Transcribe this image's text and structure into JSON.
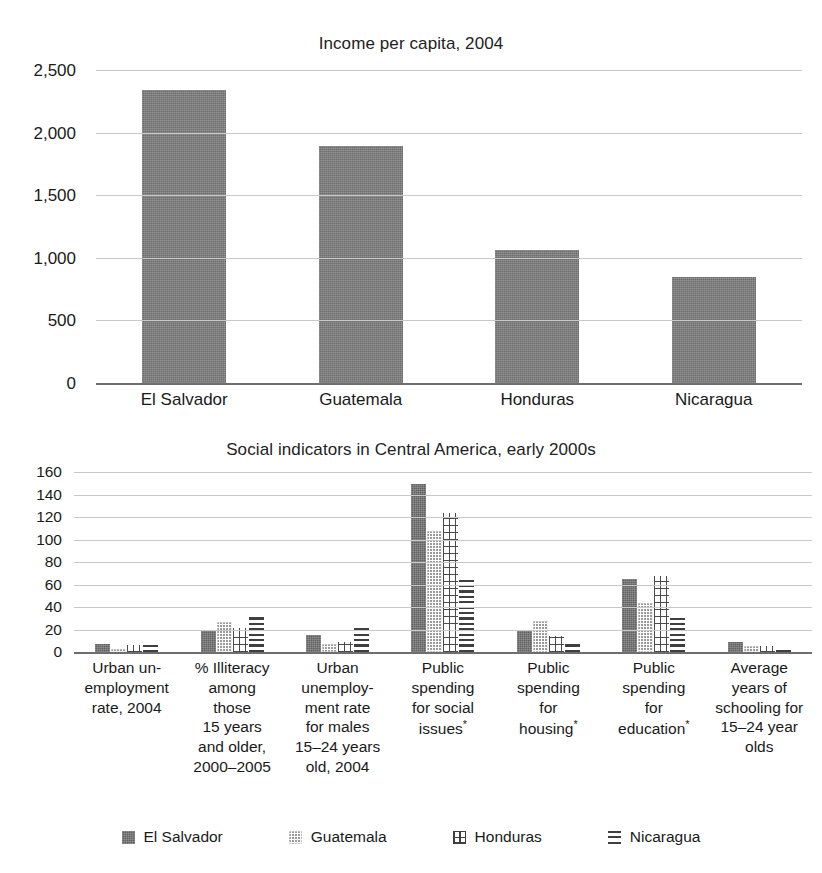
{
  "chart_data": [
    {
      "type": "bar",
      "title": "Income per capita, 2004",
      "xlabel": "",
      "ylabel": "",
      "ylim": [
        0,
        2500
      ],
      "yticks": [
        "0",
        "500",
        "1,000",
        "1,500",
        "2,000",
        "2,500"
      ],
      "grid": true,
      "categories": [
        "El Salvador",
        "Guatemala",
        "Honduras",
        "Nicaragua"
      ],
      "values": [
        2340,
        1895,
        1060,
        850
      ],
      "legend": "none"
    },
    {
      "type": "bar",
      "title": "Social indicators in Central America, early 2000s",
      "xlabel": "",
      "ylabel": "",
      "ylim": [
        0,
        160
      ],
      "yticks": [
        "0",
        "20",
        "40",
        "60",
        "80",
        "100",
        "120",
        "140",
        "160"
      ],
      "grid": true,
      "legend_position": "bottom",
      "categories": [
        "Urban un-employment rate, 2004",
        "% Illiteracy among those 15 years and older, 2000–2005",
        "Urban unemploy-ment rate for males 15–24 years old, 2004",
        "Public spending for social issues*",
        "Public spending for housing*",
        "Public spending for education*",
        "Average years of schooling for 15–24 year olds"
      ],
      "category_lines": [
        [
          "Urban un-",
          "employment",
          "rate, 2004"
        ],
        [
          "% Illiteracy",
          "among",
          "those",
          "15 years",
          "and older,",
          "2000–2005"
        ],
        [
          "Urban",
          "unemploy-",
          "ment rate",
          "for males",
          "15–24 years",
          "old, 2004"
        ],
        [
          "Public",
          "spending",
          "for social",
          "issues",
          "*"
        ],
        [
          "Public",
          "spending",
          "for",
          "housing",
          "*"
        ],
        [
          "Public",
          "spending",
          "for",
          "education",
          "*"
        ],
        [
          "Average",
          "years of",
          "schooling for",
          "15–24 year",
          "olds"
        ]
      ],
      "series": [
        {
          "name": "El Salvador",
          "pattern": "solid-gray",
          "values": [
            7,
            19,
            15,
            149,
            19,
            65,
            9
          ]
        },
        {
          "name": "Guatemala",
          "pattern": "dotted",
          "values": [
            3,
            27,
            7,
            108,
            28,
            44,
            5
          ]
        },
        {
          "name": "Honduras",
          "pattern": "crosshatch",
          "values": [
            6,
            21,
            9,
            124,
            14,
            68,
            5
          ]
        },
        {
          "name": "Nicaragua",
          "pattern": "horizontal-lines",
          "values": [
            6,
            31,
            21,
            67,
            9,
            30,
            4
          ]
        }
      ]
    }
  ],
  "top_chart": {
    "title": "Income per capita, 2004",
    "yticks": [
      "2,500",
      "2,000",
      "1,500",
      "1,000",
      "500",
      "0"
    ],
    "categories": [
      "El Salvador",
      "Guatemala",
      "Honduras",
      "Nicaragua"
    ]
  },
  "bottom_chart": {
    "title": "Social indicators in Central America, early 2000s",
    "yticks": [
      "160",
      "140",
      "120",
      "100",
      "80",
      "60",
      "40",
      "20",
      "0"
    ]
  },
  "legend": {
    "items": [
      {
        "label": "El Salvador",
        "swatch": "solid-square-swatch"
      },
      {
        "label": "Guatemala",
        "swatch": "dotted-square-swatch"
      },
      {
        "label": "Honduras",
        "swatch": "crosshatch-square-swatch"
      },
      {
        "label": "Nicaragua",
        "swatch": "horizontal-lines-swatch"
      }
    ]
  },
  "colors": {
    "bar_fill": "#7a7a7a",
    "gridline": "#c9c9c9",
    "axis": "#6e6e6e",
    "text": "#1a1a1a"
  }
}
